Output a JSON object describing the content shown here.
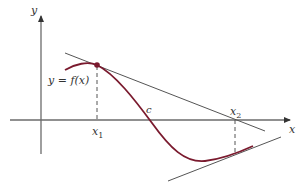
{
  "diagram": {
    "labels": {
      "y_axis": "y",
      "x_axis": "x",
      "function": "y = f(x)",
      "root": "c",
      "x1": "x",
      "x1_sub": "1",
      "x2": "x",
      "x2_sub": "2"
    },
    "colors": {
      "curve": "#7a1a2e",
      "axes": "#6b6b6b",
      "tangent": "#555555",
      "point": "#7a1a2e",
      "text": "#333333"
    },
    "elements": [
      "x-axis with arrow",
      "y-axis with arrow",
      "curve y = f(x)",
      "point (x1, f(x1))",
      "tangent line at x1 crossing x-axis at x2",
      "dashed vertical line at x1",
      "dashed vertical line at x2",
      "tangent line at x2 on curve",
      "root c where curve crosses x-axis"
    ]
  }
}
